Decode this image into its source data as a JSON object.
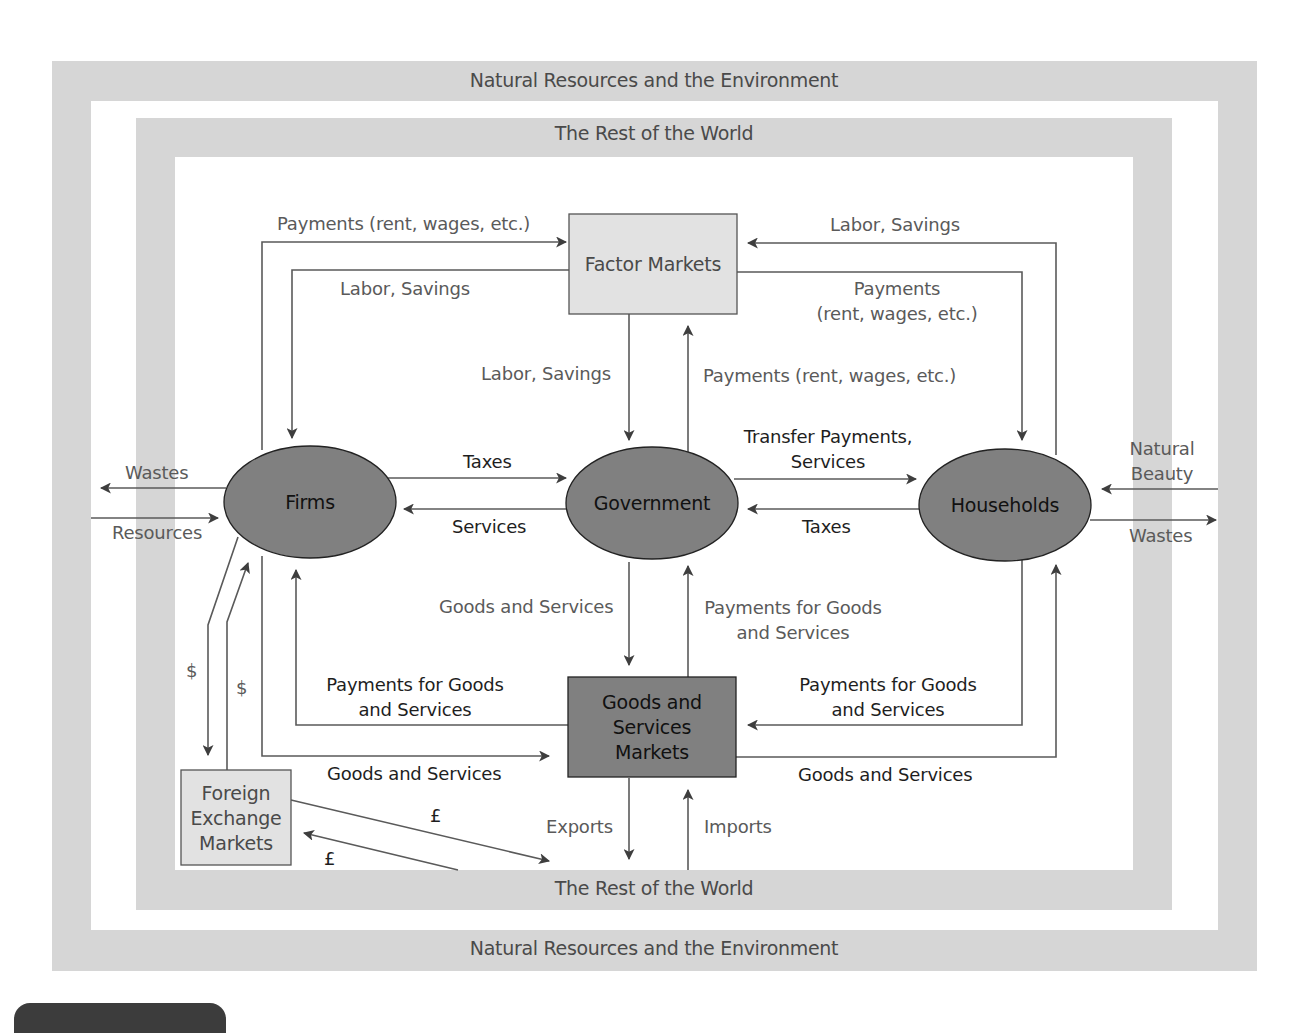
{
  "figure": {
    "outer_band_label_top": "Natural Resources and the Environment",
    "outer_band_label_bottom": "Natural Resources and the Environment",
    "inner_band_label_top": "The Rest of the World",
    "inner_band_label_bottom": "The Rest of the World",
    "colors": {
      "band": "#d6d6d6",
      "node_dark": "#808080",
      "node_light": "#e2e2e2",
      "line": "#555555",
      "label": "#5a5a5a",
      "label_dark": "#1e1e1e"
    }
  },
  "nodes": {
    "factor_markets": "Factor Markets",
    "firms": "Firms",
    "government": "Government",
    "households": "Households",
    "goods_markets_line1": "Goods and",
    "goods_markets_line2": "Services",
    "goods_markets_line3": "Markets",
    "forex_line1": "Foreign",
    "forex_line2": "Exchange",
    "forex_line3": "Markets"
  },
  "flows": {
    "firms_to_factor_payments": "Payments (rent, wages, etc.)",
    "factor_to_firms_labor": "Labor, Savings",
    "households_to_factor_labor": "Labor, Savings",
    "factor_to_households_payments_1": "Payments",
    "factor_to_households_payments_2": "(rent, wages, etc.)",
    "factor_to_gov_labor": "Labor, Savings",
    "gov_to_factor_payments": "Payments (rent, wages, etc.)",
    "firms_to_gov_taxes": "Taxes",
    "gov_to_firms_services": "Services",
    "gov_to_households_1": "Transfer Payments,",
    "gov_to_households_2": "Services",
    "households_to_gov_taxes": "Taxes",
    "firms_wastes": "Wastes",
    "firms_resources": "Resources",
    "households_natural_beauty_1": "Natural",
    "households_natural_beauty_2": "Beauty",
    "households_wastes": "Wastes",
    "markets_to_gov_goods": "Goods and Services",
    "gov_to_markets_payments_1": "Payments for Goods",
    "gov_to_markets_payments_2": "and Services",
    "markets_to_firms_payments_1": "Payments for Goods",
    "markets_to_firms_payments_2": "and Services",
    "firms_to_markets_goods": "Goods and Services",
    "households_to_markets_payments_1": "Payments for Goods",
    "households_to_markets_payments_2": "and Services",
    "markets_to_households_goods": "Goods and Services",
    "firms_to_forex_dollar": "$",
    "forex_to_firms_dollar": "$",
    "forex_to_world_pound": "£",
    "world_to_forex_pound": "£",
    "exports": "Exports",
    "imports": "Imports"
  }
}
